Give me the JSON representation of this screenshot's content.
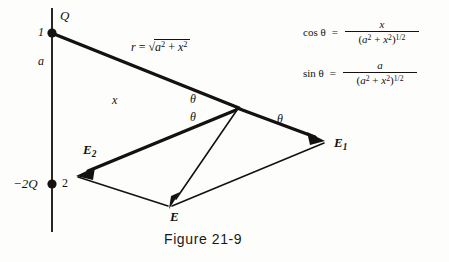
{
  "figure": {
    "caption": "Figure  21-9",
    "axes": {
      "vertical_axis_name": "vertical-axis",
      "horizontal_axis_name": "horizontal-axis",
      "x_label": "x",
      "a_label": "a"
    },
    "charges": [
      {
        "id": "charge-1",
        "number_label": "1",
        "charge_label": "Q",
        "position": "top"
      },
      {
        "id": "charge-2",
        "number_label": "2",
        "charge_label": "−2Q",
        "position": "bottom"
      }
    ],
    "angles": [
      {
        "name": "theta-upper-left",
        "label": "θ"
      },
      {
        "name": "theta-lower-left",
        "label": "θ"
      },
      {
        "name": "theta-right",
        "label": "θ"
      }
    ],
    "vectors": [
      {
        "name": "E1",
        "base": "E",
        "subscript": "1"
      },
      {
        "name": "E2",
        "base": "E",
        "subscript": "2"
      },
      {
        "name": "E",
        "base": "E",
        "subscript": ""
      }
    ],
    "r_label": {
      "lhs": "r",
      "eq": "=",
      "radicand_first": "a",
      "radicand_first_sup": "2",
      "plus": "+",
      "radicand_second": "x",
      "radicand_second_sup": "2",
      "radical_sign": "√"
    },
    "formulas": [
      {
        "name": "cos-theta-formula",
        "lhs": "cos θ",
        "eq": "=",
        "numerator": "x",
        "denominator_open": "(",
        "denominator_a": "a",
        "denominator_a_sup": "2",
        "denominator_plus": "+",
        "denominator_x": "x",
        "denominator_x_sup": "2",
        "denominator_close": ")",
        "denominator_exp": "1/2"
      },
      {
        "name": "sin-theta-formula",
        "lhs": "sin θ",
        "eq": "=",
        "numerator": "a",
        "denominator_open": "(",
        "denominator_a": "a",
        "denominator_a_sup": "2",
        "denominator_plus": "+",
        "denominator_x": "x",
        "denominator_x_sup": "2",
        "denominator_close": ")",
        "denominator_exp": "1/2"
      }
    ],
    "colors": {
      "ink": "#141210",
      "paper": "#fdfdfb",
      "axis": "#2a2622",
      "axis_tail_tint": "#8a4a44"
    }
  }
}
